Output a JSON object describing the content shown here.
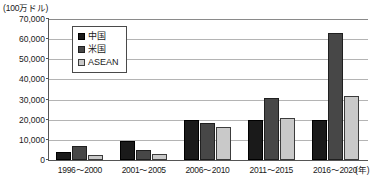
{
  "unit_label": "(100万ドル)",
  "xaxis_unit": "(年)",
  "legend": {
    "items": [
      {
        "label": "中国",
        "color": "#1a1a1a",
        "swatch_icon": "filled-square-icon"
      },
      {
        "label": "米国",
        "color": "#474747",
        "swatch_icon": "filled-square-icon"
      },
      {
        "label": "ASEAN",
        "color": "#c9c9c9",
        "swatch_icon": "outlined-square-icon"
      }
    ]
  },
  "yticks": [
    "70,000",
    "60,000",
    "50,000",
    "40,000",
    "30,000",
    "20,000",
    "10,000",
    "0"
  ],
  "chart_data": {
    "type": "bar",
    "title": "",
    "xlabel": "(年)",
    "ylabel": "(100万ドル)",
    "ylim": [
      0,
      70000
    ],
    "ytick_step": 10000,
    "grid": true,
    "legend_position": "top-left-inside",
    "categories": [
      "1996～2000",
      "2001～2005",
      "2006～2010",
      "2011～2015",
      "2016～2020"
    ],
    "series": [
      {
        "name": "中国",
        "color": "#1a1a1a",
        "values": [
          4000,
          9500,
          20000,
          20000,
          20000
        ]
      },
      {
        "name": "米国",
        "color": "#474747",
        "values": [
          7000,
          5000,
          18500,
          31000,
          63000
        ]
      },
      {
        "name": "ASEAN",
        "color": "#c9c9c9",
        "values": [
          2500,
          3000,
          16500,
          21000,
          32000
        ]
      }
    ]
  }
}
